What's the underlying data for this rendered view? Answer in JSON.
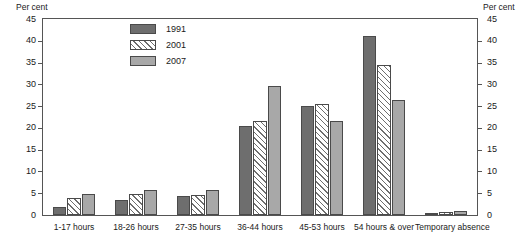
{
  "chart_data": {
    "type": "bar",
    "title": "",
    "subtitle": "",
    "xlabel": "",
    "ylabel": "Per cent",
    "ylabel_right": "Per cent",
    "ylim": [
      0,
      45
    ],
    "yticks": [
      0,
      5,
      10,
      15,
      20,
      25,
      30,
      35,
      40,
      45
    ],
    "grid": false,
    "legend_position": "top-left-inside",
    "categories": [
      "1-17 hours",
      "18-26 hours",
      "27-35 hours",
      "36-44 hours",
      "45-53 hours",
      "54 hours & over",
      "Temporary absence"
    ],
    "series": [
      {
        "name": "1991",
        "color": "#6e6e6e",
        "fill": "solid-dark-gray",
        "values": [
          1.8,
          3.5,
          4.3,
          20.5,
          25.0,
          41.0,
          0.2
        ]
      },
      {
        "name": "2001",
        "color": "#ffffff",
        "fill": "white-diagonal-hatch",
        "values": [
          4.0,
          4.8,
          4.5,
          21.6,
          25.6,
          34.5,
          0.6
        ]
      },
      {
        "name": "2007",
        "color": "#a8a8a8",
        "fill": "solid-medium-gray",
        "values": [
          4.9,
          5.7,
          5.8,
          29.7,
          21.6,
          26.3,
          1.0
        ]
      }
    ]
  }
}
